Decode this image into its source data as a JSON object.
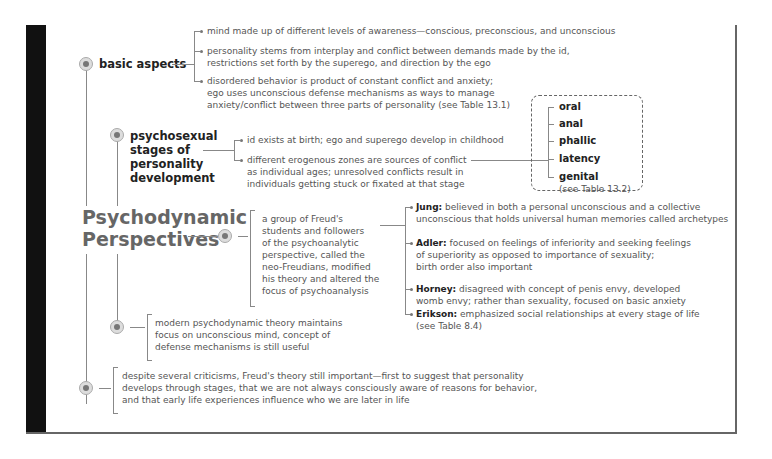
{
  "title": "Psychodynamic Perspectives",
  "title_lines": [
    "Psychodynamic",
    "Perspectives"
  ],
  "basic_aspects": {
    "label": "basic aspects",
    "items": [
      [
        "mind made up of different levels of awareness—conscious, preconscious, and unconscious"
      ],
      [
        "personality stems from interplay and conflict between demands made by the id,",
        "restrictions set forth by the superego, and direction by the ego"
      ],
      [
        "disordered behavior is product of constant conflict and anxiety;",
        "ego uses unconscious defense mechanisms as ways to manage",
        "anxiety/conflict between three parts of personality (see Table 13.1)"
      ]
    ]
  },
  "psychosexual": {
    "label_lines": [
      "psychosexual",
      "stages of",
      "personality",
      "development"
    ],
    "items": [
      [
        "id exists at birth; ego and superego develop in childhood"
      ],
      [
        "different erogenous zones are sources of conflict",
        "as individual ages; unresolved conflicts result in",
        "individuals getting stuck or fixated at that stage"
      ]
    ],
    "stages": [
      "oral",
      "anal",
      "phallic",
      "latency",
      "genital"
    ],
    "stages_note": "(see Table 13.2)"
  },
  "neo_freudians": {
    "description_lines": [
      "a group of Freud's",
      "students and followers",
      "of the psychoanalytic",
      "perspective, called the",
      "neo-Freudians, modified",
      "his theory and altered the",
      "focus of psychoanalysis"
    ],
    "theorists": [
      {
        "name": "Jung:",
        "lines": [
          "believed in both a personal unconscious and a collective",
          "unconscious that holds universal human memories called archetypes"
        ]
      },
      {
        "name": "Adler:",
        "lines": [
          "focused on feelings of inferiority and seeking feelings",
          "of superiority as opposed to importance of sexuality;",
          "birth order also important"
        ]
      },
      {
        "name": "Horney:",
        "lines": [
          "disagreed with concept of penis envy, developed",
          "womb envy; rather than sexuality, focused on basic anxiety"
        ]
      },
      {
        "name": "Erikson:",
        "lines": [
          "emphasized social relationships at every stage of life",
          "(see Table 8.4)"
        ]
      }
    ]
  },
  "modern": {
    "lines": [
      "modern psychodynamic theory maintains",
      "focus on unconscious mind, concept of",
      "defense mechanisms is still useful"
    ]
  },
  "legacy": {
    "lines": [
      "despite several criticisms, Freud's theory still important—first to suggest that personality",
      "develops through stages, that we are not always consciously aware of reasons for behavior,",
      "and that early life experiences influence who we are later in life"
    ]
  },
  "colors": {
    "frame_bar": "#111111",
    "heading": "#666666",
    "label": "#222222",
    "body_text": "#555555",
    "lines": "#888888"
  }
}
